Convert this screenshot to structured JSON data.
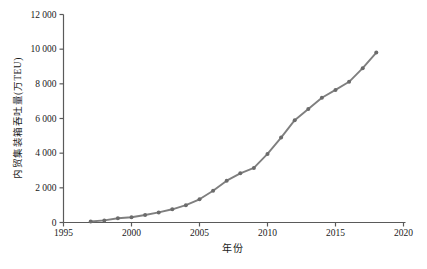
{
  "figure": {
    "background": "#ffffff",
    "axis_color": "#5a5a5a",
    "tick_label_color": "#1a1a1a"
  },
  "chart_data": {
    "type": "line",
    "title": "",
    "xlabel": "年份",
    "ylabel": "内贸集装箱吞吐量(万TEU)",
    "series_name": "内贸集装箱吞吐量",
    "x": [
      1997,
      1998,
      1999,
      2000,
      2001,
      2002,
      2003,
      2004,
      2005,
      2006,
      2007,
      2008,
      2009,
      2010,
      2011,
      2012,
      2013,
      2014,
      2015,
      2016,
      2017,
      2018
    ],
    "values": [
      55,
      120,
      240,
      300,
      430,
      580,
      760,
      1000,
      1340,
      1830,
      2410,
      2840,
      3150,
      3960,
      4900,
      5900,
      6550,
      7200,
      7650,
      8120,
      8900,
      9800
    ],
    "xlim": [
      1995,
      2020
    ],
    "ylim": [
      0,
      12000
    ],
    "x_ticks": [
      1995,
      2000,
      2005,
      2010,
      2015,
      2020
    ],
    "x_tick_labels": [
      "1995",
      "2000",
      "2005",
      "2010",
      "2015",
      "2020"
    ],
    "y_ticks": [
      0,
      2000,
      4000,
      6000,
      8000,
      10000,
      12000
    ],
    "y_tick_labels": [
      "0",
      "2 000",
      "4 000",
      "6 000",
      "8 000",
      "10 000",
      "12 000"
    ],
    "grid": false,
    "legend": "none",
    "marker": "circle",
    "line_color": "#7f7f7f",
    "marker_color": "#6b6b6b"
  }
}
